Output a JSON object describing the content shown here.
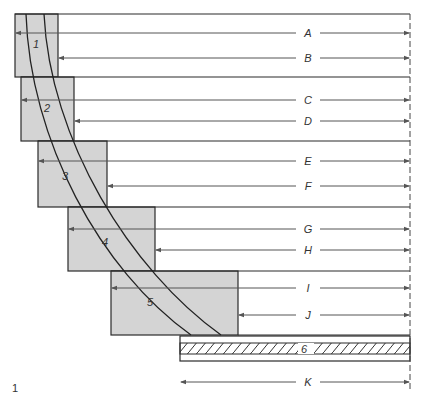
{
  "figure": {
    "number": "1",
    "colors": {
      "box_fill": "#d4d4d4",
      "outline": "#2a2a2a",
      "arrow": "#555555",
      "background": "#ffffff"
    },
    "boxes": [
      {
        "id": "1",
        "label": "1",
        "x": 15,
        "y": 14,
        "w": 43,
        "h": 63
      },
      {
        "id": "2",
        "label": "2",
        "x": 21,
        "y": 77,
        "w": 53,
        "h": 64
      },
      {
        "id": "3",
        "label": "3",
        "x": 38,
        "y": 141,
        "w": 69,
        "h": 66
      },
      {
        "id": "4",
        "label": "4",
        "x": 68,
        "y": 207,
        "w": 87,
        "h": 64
      },
      {
        "id": "5",
        "label": "5",
        "x": 111,
        "y": 271,
        "w": 127,
        "h": 64
      }
    ],
    "strip": {
      "label": "6",
      "x": 180,
      "y": 336,
      "w": 230,
      "h": 25
    },
    "dimensions": [
      {
        "label": "A",
        "y": 33,
        "from": 15
      },
      {
        "label": "B",
        "y": 58,
        "from": 58
      },
      {
        "label": "C",
        "y": 100,
        "from": 21
      },
      {
        "label": "D",
        "y": 121,
        "from": 74
      },
      {
        "label": "E",
        "y": 161,
        "from": 38
      },
      {
        "label": "F",
        "y": 186,
        "from": 107
      },
      {
        "label": "G",
        "y": 229,
        "from": 68
      },
      {
        "label": "H",
        "y": 250,
        "from": 155
      },
      {
        "label": "I",
        "y": 288,
        "from": 111
      },
      {
        "label": "J",
        "y": 315,
        "from": 238
      },
      {
        "label": "K",
        "y": 382,
        "from": 180
      }
    ]
  }
}
